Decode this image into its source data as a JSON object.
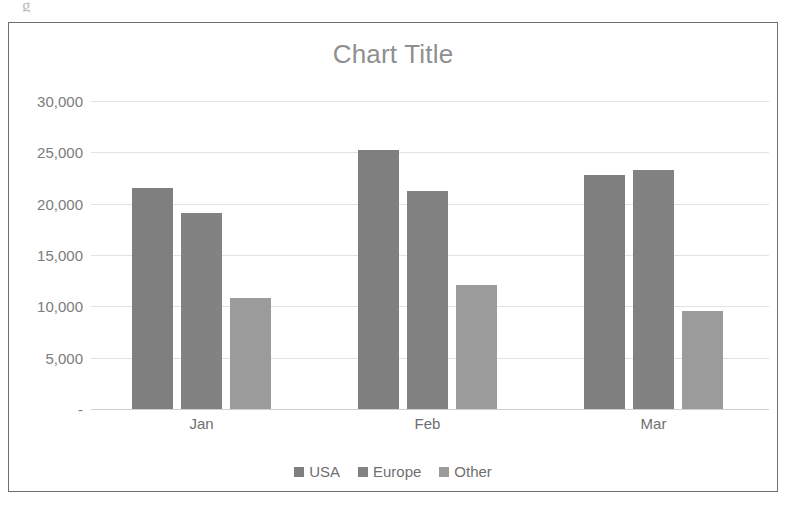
{
  "artifact": {
    "text": "g"
  },
  "chart_data": {
    "type": "bar",
    "title": "Chart Title",
    "xlabel": "",
    "ylabel": "",
    "categories": [
      "Jan",
      "Feb",
      "Mar"
    ],
    "series": [
      {
        "name": "USA",
        "values": [
          21500,
          25200,
          22800
        ],
        "color": "#7f7f7f"
      },
      {
        "name": "Europe",
        "values": [
          19100,
          21200,
          23300
        ],
        "color": "#828282"
      },
      {
        "name": "Other",
        "values": [
          10800,
          12100,
          9500
        ],
        "color": "#9b9b9b"
      }
    ],
    "ylim": [
      0,
      30000
    ],
    "yticks": [
      30000,
      25000,
      20000,
      15000,
      10000,
      5000,
      0
    ],
    "ytick_labels": [
      "30,000",
      "25,000",
      "20,000",
      "15,000",
      "10,000",
      "5,000",
      "-"
    ],
    "grid": true,
    "legend_position": "bottom",
    "title_color": "#8f8f8f",
    "axis_text_color": "#7c7c7c",
    "gridline_color": "#e2e2e2",
    "plot_background": "#ffffff",
    "frame_border_color": "#6e6e6e"
  }
}
